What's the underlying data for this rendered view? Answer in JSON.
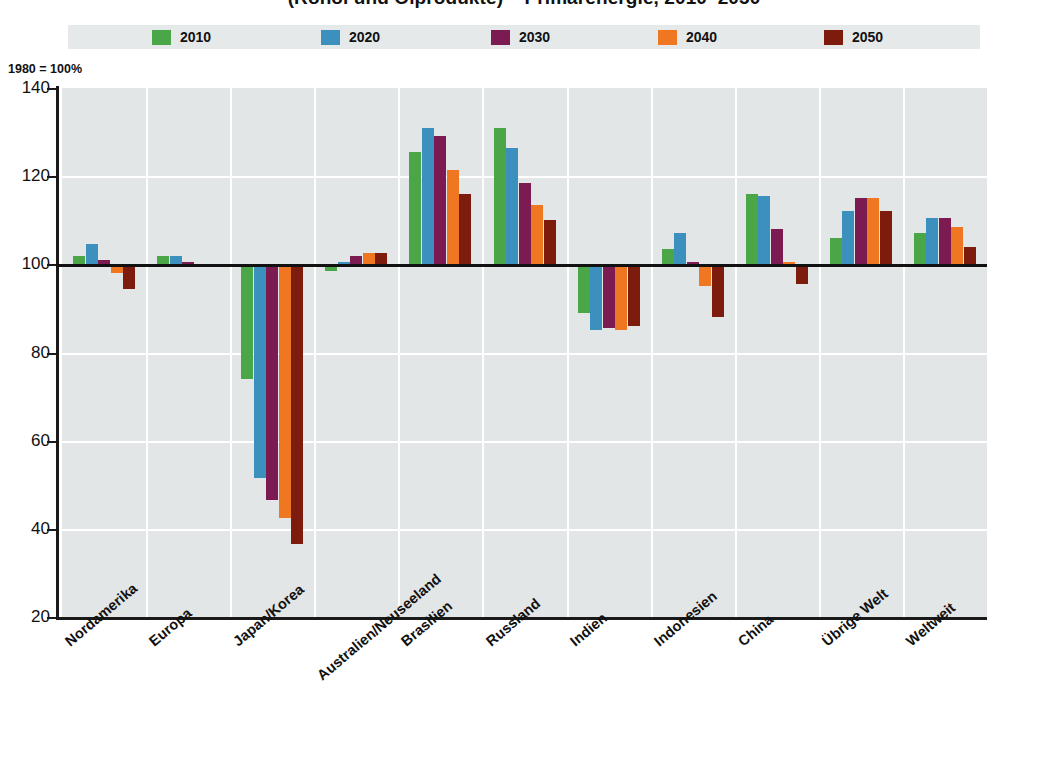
{
  "title": "(Rohöl und Ölprodukte) – Primärenergie, 2010–2050",
  "axis_note": "1980 = 100%",
  "legend": {
    "items": [
      {
        "label": "2010",
        "color": "#4ba648"
      },
      {
        "label": "2020",
        "color": "#3b90bd"
      },
      {
        "label": "2030",
        "color": "#7b1b52"
      },
      {
        "label": "2040",
        "color": "#ef7722"
      },
      {
        "label": "2050",
        "color": "#7d1c0d"
      }
    ]
  },
  "yaxis": {
    "ticks": [
      "140",
      "120",
      "100",
      "80",
      "60",
      "40",
      "20"
    ],
    "min": 20,
    "max": 140,
    "reference": 100
  },
  "chart_data": {
    "type": "bar",
    "title": "(Rohöl und Ölprodukte) – Primärenergie, 2010–2050",
    "xlabel": "",
    "ylabel": "1980 = 100%",
    "ylim": [
      20,
      140
    ],
    "grid": true,
    "legend_position": "top",
    "reference_line": 100,
    "categories": [
      "Nordamerika",
      "Europa",
      "Japan/Korea",
      "Australien/Neuseeland",
      "Brasilien",
      "Russland",
      "Indien",
      "Indonesien",
      "China",
      "Übrige Welt",
      "Weltweit"
    ],
    "series": [
      {
        "name": "2010",
        "color": "#4ba648",
        "values": [
          102,
          102,
          74,
          98.5,
          125.5,
          131,
          89,
          103.5,
          116,
          106,
          107
        ]
      },
      {
        "name": "2020",
        "color": "#3b90bd",
        "values": [
          104.5,
          102,
          51.5,
          100.5,
          131,
          126.5,
          85,
          107,
          115.5,
          112,
          110.5
        ]
      },
      {
        "name": "2030",
        "color": "#7b1b52",
        "values": [
          101,
          100.5,
          46.5,
          102,
          129,
          118.5,
          85.5,
          100.5,
          108,
          115,
          110.5
        ]
      },
      {
        "name": "2040",
        "color": "#ef7722",
        "values": [
          98,
          99.5,
          42.5,
          102.5,
          121.5,
          113.5,
          85,
          95,
          100.5,
          115,
          108.5
        ]
      },
      {
        "name": "2050",
        "color": "#7d1c0d",
        "values": [
          94.5,
          99.5,
          36.5,
          102.5,
          116,
          110,
          86,
          88,
          95.5,
          112,
          104
        ]
      }
    ]
  }
}
